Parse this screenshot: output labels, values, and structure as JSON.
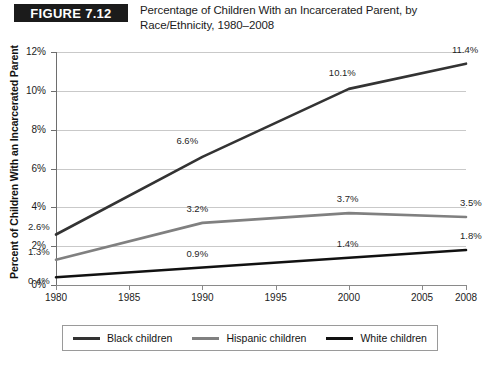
{
  "header": {
    "badge": "FIGURE 7.12",
    "title": "Percentage of Children With an Incarcerated Parent, by Race/Ethnicity, 1980–2008"
  },
  "colors": {
    "black_children": "#333333",
    "hispanic_children": "#808080",
    "white_children": "#111111",
    "gridline": "#c9c9c9",
    "axis": "#6e6e6e",
    "badge_background": "#1b1b1b",
    "badge_text": "#ffffff"
  },
  "chart_data": {
    "type": "line",
    "title": "Percentage of Children With an Incarcerated Parent, by Race/Ethnicity, 1980–2008",
    "xlabel": "",
    "ylabel": "Percent of Children With an Incarcerated Parent",
    "x": [
      1980,
      1990,
      2000,
      2008
    ],
    "xlim": [
      1980,
      2008
    ],
    "ylim": [
      0,
      12
    ],
    "ytick_labels": [
      "0%",
      "2%",
      "4%",
      "6%",
      "8%",
      "10%",
      "12%"
    ],
    "ytick_values": [
      0,
      2,
      4,
      6,
      8,
      10,
      12
    ],
    "xtick_labels": [
      "1980",
      "1985",
      "1990",
      "1995",
      "2000",
      "2005",
      "2008"
    ],
    "xtick_values": [
      1980,
      1985,
      1990,
      1995,
      2000,
      2005,
      2008
    ],
    "grid": true,
    "legend_position": "bottom",
    "series": [
      {
        "name": "Black children",
        "color": "#333333",
        "values": [
          2.6,
          6.6,
          10.1,
          11.4
        ],
        "labels": [
          "2.6%",
          "6.6%",
          "10.1%",
          "11.4%"
        ]
      },
      {
        "name": "Hispanic children",
        "color": "#808080",
        "values": [
          1.3,
          3.2,
          3.7,
          3.5
        ],
        "labels": [
          "1.3%",
          "3.2%",
          "3.7%",
          "3.5%"
        ]
      },
      {
        "name": "White children",
        "color": "#111111",
        "values": [
          0.4,
          0.9,
          1.4,
          1.8
        ],
        "labels": [
          "0.4%",
          "0.9%",
          "1.4%",
          "1.8%"
        ]
      }
    ]
  },
  "legend": {
    "items": [
      {
        "label": "Black children"
      },
      {
        "label": "Hispanic children"
      },
      {
        "label": "White children"
      }
    ]
  }
}
